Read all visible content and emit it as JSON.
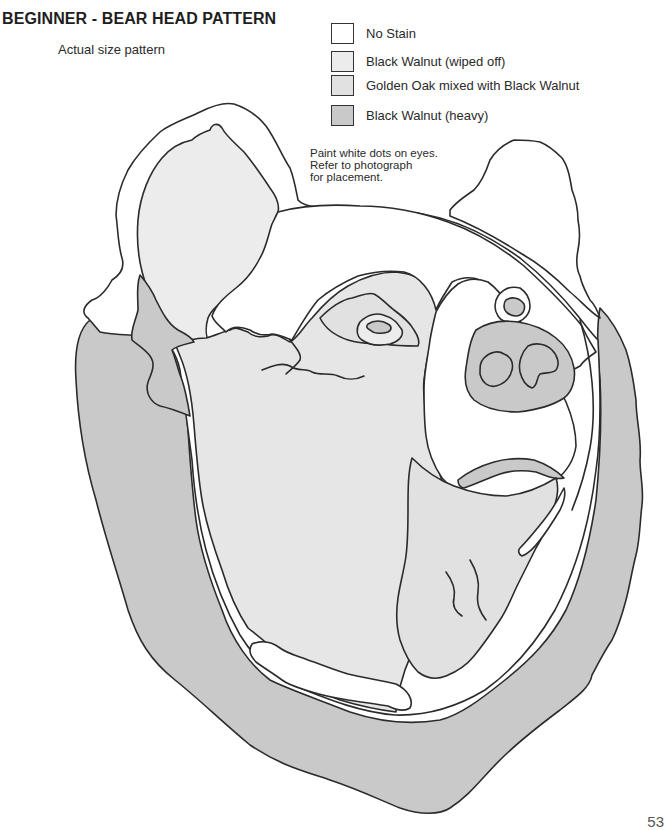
{
  "page": {
    "title": "BEGINNER - BEAR HEAD PATTERN",
    "subtitle": "Actual size pattern",
    "page_number": "53"
  },
  "legend": {
    "items": [
      {
        "label": "No Stain",
        "color": "#ffffff"
      },
      {
        "label": "Black Walnut (wiped off)",
        "color": "#ececec"
      },
      {
        "label": "Golden Oak mixed with Black Walnut",
        "color": "#e1e1e1"
      },
      {
        "label": "Black Walnut (heavy)",
        "color": "#c9c9c9"
      }
    ]
  },
  "note": {
    "lines": [
      "Paint white dots on eyes.",
      "Refer to photograph",
      "for placement."
    ]
  },
  "colors": {
    "outline": "#2b2b2b",
    "no_stain": "#ffffff",
    "wiped": "#ececec",
    "golden_oak": "#e1e1e1",
    "heavy": "#c9c9c9"
  }
}
